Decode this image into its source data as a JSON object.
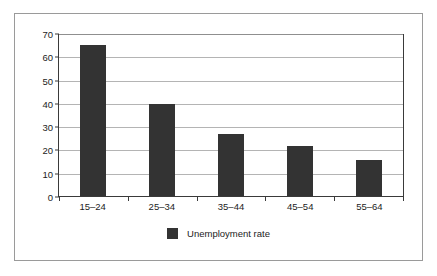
{
  "chart_data": {
    "type": "bar",
    "title": "",
    "xlabel": "",
    "ylabel": "",
    "categories": [
      "15–24",
      "25–34",
      "35–44",
      "45–54",
      "55–64"
    ],
    "series": [
      {
        "name": "Unemployment rate",
        "values": [
          65,
          39.5,
          26.5,
          21.5,
          15.5
        ],
        "color": "#333333"
      }
    ],
    "ylim": [
      0,
      70
    ],
    "ytick_labels": [
      "70",
      "60",
      "50",
      "40",
      "30",
      "20",
      "10",
      "0"
    ],
    "ytick_values": [
      70,
      60,
      50,
      40,
      30,
      20,
      10,
      0
    ],
    "grid": true,
    "legend_position": "bottom",
    "legend": [
      "Unemployment rate"
    ]
  },
  "legend": {
    "label": "Unemployment rate",
    "swatch_color": "#333333"
  },
  "frame": {
    "border_color": "#9a9a9a",
    "axis_color": "#3a3a3a",
    "gridline_color": "#b4b4b4",
    "background": "#ffffff"
  }
}
